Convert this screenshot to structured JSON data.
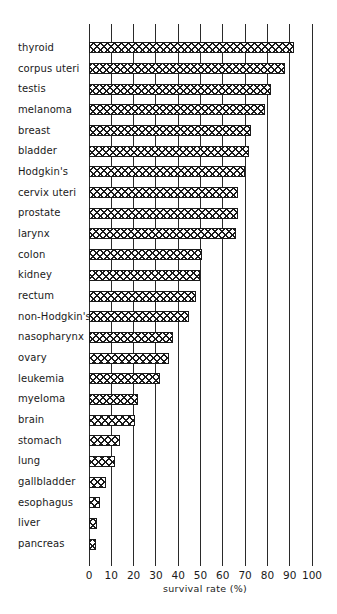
{
  "chart_data": {
    "type": "bar",
    "orientation": "horizontal",
    "title": "",
    "xlabel": "survival rate (%)",
    "ylabel": "",
    "xlim": [
      0,
      100
    ],
    "xticks": [
      0,
      10,
      20,
      30,
      40,
      50,
      60,
      70,
      80,
      90,
      100
    ],
    "grid": "vertical gridlines at every 10",
    "legend": null,
    "bar_fill": "crosshatch",
    "categories": [
      "thyroid",
      "corpus uteri",
      "testis",
      "melanoma",
      "breast",
      "bladder",
      "Hodgkin's",
      "cervix uteri",
      "prostate",
      "larynx",
      "colon",
      "kidney",
      "rectum",
      "non-Hodgkin's",
      "nasopharynx",
      "ovary",
      "leukemia",
      "myeloma",
      "brain",
      "stomach",
      "lung",
      "gallbladder",
      "esophagus",
      "liver",
      "pancreas"
    ],
    "values": [
      92,
      88,
      82,
      79,
      73,
      72,
      70,
      67,
      67,
      66,
      51,
      50,
      48,
      45,
      38,
      36,
      32,
      22,
      21,
      14,
      12,
      8,
      5,
      4,
      3.5
    ]
  },
  "layout": {
    "plot_left": 88.5,
    "px_per_unit": 2.23,
    "row_top_start": 42.3,
    "row_pitch": 20.68,
    "colors": {
      "ink": "#1a1a1a",
      "background": "#ffffff"
    }
  }
}
